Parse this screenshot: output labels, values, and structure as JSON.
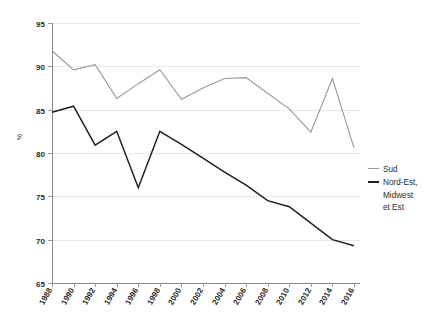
{
  "chart_data": {
    "type": "line",
    "title": "",
    "xlabel": "",
    "ylabel": "%",
    "ylim": [
      65,
      95
    ],
    "ytick_step": 5,
    "yticks": [
      "65",
      "70",
      "75",
      "80",
      "85",
      "90",
      "95"
    ],
    "grid": true,
    "legend_position": "right",
    "categories": [
      "1988",
      "1989",
      "1990",
      "1991",
      "1992",
      "1993",
      "1994",
      "1995",
      "1996",
      "1997",
      "1998",
      "1999",
      "2000",
      "2001",
      "2002",
      "2003",
      "2004",
      "2005",
      "2006",
      "2007",
      "2008",
      "2009",
      "2010",
      "2011",
      "2012",
      "2013",
      "2014",
      "2015",
      "2016"
    ],
    "xtick_labels": [
      "1988",
      "1990",
      "1992",
      "1994",
      "1996",
      "1998",
      "2000",
      "2002",
      "2004",
      "2006",
      "2008",
      "2010",
      "2012",
      "2014",
      "2016"
    ],
    "series": [
      {
        "name": "Sud",
        "color": "#9a9a9a",
        "width": 1.1,
        "x": [
          1988,
          1990,
          1992,
          1994,
          1996,
          1998,
          2000,
          2002,
          2004,
          2006,
          2008,
          2010,
          2012,
          2014,
          2016
        ],
        "values": [
          91.8,
          89.6,
          90.2,
          86.3,
          88.0,
          89.6,
          86.2,
          87.5,
          88.6,
          88.7,
          86.9,
          85.1,
          82.4,
          88.6,
          80.6
        ]
      },
      {
        "name": "Nord-Est, Midwest et Est",
        "color": "#1f1f1f",
        "width": 1.5,
        "x": [
          1988,
          1990,
          1992,
          1994,
          1996,
          1998,
          2000,
          2002,
          2004,
          2006,
          2008,
          2010,
          2012,
          2014,
          2016
        ],
        "values": [
          84.7,
          85.4,
          80.9,
          82.5,
          76.0,
          82.5,
          81.0,
          79.4,
          77.8,
          76.3,
          74.5,
          73.8,
          71.9,
          70.0,
          69.3
        ]
      }
    ]
  },
  "legend": {
    "entries": [
      {
        "label": "Sud"
      },
      {
        "label": "Nord-Est,\nMidwest\net Est"
      }
    ]
  },
  "axis": {
    "y_title": "%"
  }
}
